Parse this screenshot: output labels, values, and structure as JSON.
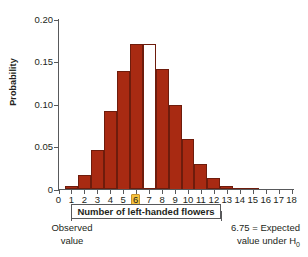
{
  "chart_data": {
    "type": "bar",
    "title": "",
    "xlabel": "Number of left-handed flowers",
    "ylabel": "Probability",
    "categories": [
      "0",
      "1",
      "2",
      "3",
      "4",
      "5",
      "6",
      "7",
      "8",
      "9",
      "10",
      "11",
      "12",
      "13",
      "14",
      "15",
      "16",
      "17",
      "18"
    ],
    "values": [
      0.0,
      0.004,
      0.017,
      0.046,
      0.092,
      0.14,
      0.171,
      0.171,
      0.142,
      0.1,
      0.06,
      0.03,
      0.013,
      0.0045,
      0.001,
      0.0002,
      0.0,
      0.0,
      0.0
    ],
    "bar_styles": [
      "filled",
      "filled",
      "filled",
      "filled",
      "filled",
      "filled",
      "filled",
      "hollow",
      "filled",
      "filled",
      "filled",
      "filled",
      "filled",
      "filled",
      "filled",
      "filled",
      "filled",
      "filled",
      "filled"
    ],
    "xlim": [
      0,
      18
    ],
    "ylim": [
      0,
      0.2
    ],
    "ytick_values": [
      0,
      0.05,
      0.1,
      0.15,
      0.2
    ],
    "ytick_labels": [
      "0",
      "0.05",
      "0.10",
      "0.15",
      "0.20"
    ],
    "grid": false,
    "legend": "none",
    "bar_color": "#a82a12",
    "bar_edge_color": "#6e1c0c",
    "axis_color": "#58595b",
    "highlight_color": "#f6c33d",
    "highlighted_category": "6",
    "annotations": [
      {
        "name": "observed-value",
        "text_line1": "Observed",
        "text_line2": "value",
        "points_to": "6"
      },
      {
        "name": "expected-value",
        "text_line1": "6.75 = Expected",
        "text_line2": "value under H",
        "subscript": "0",
        "points_to": "6.75"
      }
    ]
  },
  "axis": {
    "y_label": "Probability",
    "y_ticks": [
      "0",
      "0.05",
      "0.10",
      "0.15",
      "0.20"
    ],
    "x_ticks": [
      "0",
      "1",
      "2",
      "3",
      "4",
      "5",
      "6",
      "7",
      "8",
      "9",
      "10",
      "11",
      "12",
      "13",
      "14",
      "15",
      "16",
      "17",
      "18"
    ],
    "x_title": "Number of left-handed flowers"
  },
  "notes": {
    "observed_line1": "Observed",
    "observed_line2": "value",
    "expected_line1": "6.75 = Expected",
    "expected_line2": "value under H",
    "expected_subscript": "0"
  }
}
